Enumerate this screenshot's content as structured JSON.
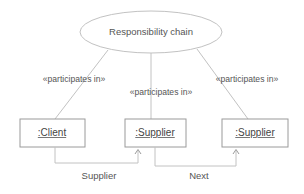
{
  "diagram": {
    "type": "uml-collaboration-diagram",
    "title": "Responsibility chain",
    "background_color": "#ffffff",
    "line_color": "#b8b8b8",
    "text_color": "#555555",
    "collaboration": {
      "name": "Responsibility chain",
      "shape": "ellipse",
      "center_x": 151,
      "center_y": 32,
      "radius_x": 71,
      "radius_y": 21
    },
    "roles": [
      {
        "id": "client",
        "label": ":Client",
        "shape": "rectangle",
        "x": 20,
        "y": 119,
        "width": 65,
        "height": 28,
        "underlined": true
      },
      {
        "id": "supplier-mid",
        "label": ":Supplier",
        "shape": "rectangle",
        "x": 125,
        "y": 119,
        "width": 61,
        "height": 28,
        "underlined": true
      },
      {
        "id": "supplier-right",
        "label": ":Supplier",
        "shape": "rectangle",
        "x": 222,
        "y": 119,
        "width": 66,
        "height": 28,
        "underlined": true
      }
    ],
    "participation_links": [
      {
        "id": "link-client",
        "stereotype": "«participates in»",
        "label_x": 74,
        "label_y": 79,
        "from_x": 108,
        "from_y": 50,
        "to_x": 55,
        "to_y": 119
      },
      {
        "id": "link-supplier-mid",
        "stereotype": "«participates in»",
        "label_x": 161,
        "label_y": 92,
        "from_x": 151,
        "from_y": 53,
        "to_x": 151,
        "to_y": 119
      },
      {
        "id": "link-supplier-right",
        "stereotype": "«participates in»",
        "label_x": 247,
        "label_y": 79,
        "from_x": 197,
        "from_y": 49,
        "to_x": 248,
        "to_y": 119
      }
    ],
    "associations": [
      {
        "id": "assoc-supplier",
        "label": "Supplier",
        "label_x": 99,
        "label_y": 175,
        "source_role": "client",
        "target_role": "supplier-mid",
        "from_x": 55,
        "from_y": 147,
        "to_x": 138,
        "to_y": 147,
        "drop_y": 163,
        "arrow": "open-v"
      },
      {
        "id": "assoc-next",
        "label": "Next",
        "label_x": 199,
        "label_y": 175,
        "source_role": "supplier-mid",
        "target_role": "supplier-right",
        "from_x": 155,
        "from_y": 147,
        "to_x": 236,
        "to_y": 147,
        "drop_y": 166,
        "arrow": "open-v"
      }
    ]
  }
}
